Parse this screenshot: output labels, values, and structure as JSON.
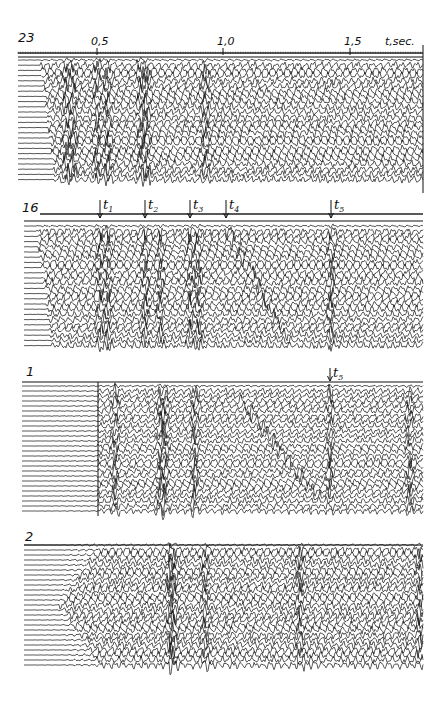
{
  "chart_data": {
    "type": "seismogram",
    "title": "",
    "xlabel": "t,sec.",
    "x_ticks": [
      {
        "label": "0,5",
        "value": 0.5,
        "px": 97
      },
      {
        "label": "1,0",
        "value": 1.0,
        "px": 223
      },
      {
        "label": "1,5",
        "value": 1.5,
        "px": 350
      }
    ],
    "x_axis_label": {
      "text": "t,sec.",
      "px": 385
    },
    "time_to_px": {
      "t0_px": -29,
      "px_per_sec": 253
    },
    "panels": [
      {
        "id": "23",
        "label": "23",
        "label_pos": [
          18,
          31
        ],
        "axis_y": 53,
        "top_line_y": 57,
        "trace_top": 60,
        "trace_count": 24,
        "trace_spacing": 5.2,
        "x_start": 18,
        "x_end": 423,
        "onset_start_px": 40,
        "onset_end_px": 55,
        "onset_direction": "diagonal",
        "intensity": 1.0,
        "bright_events_px": [
          66,
          73,
          97,
          108,
          141,
          147,
          205
        ],
        "markers": []
      },
      {
        "id": "16",
        "label": "16",
        "label_pos": [
          22,
          201
        ],
        "axis_y": 214,
        "top_line_y": 221,
        "trace_top": 226,
        "trace_count": 24,
        "trace_spacing": 5.2,
        "x_start": 24,
        "x_end": 423,
        "onset_start_px": 36,
        "onset_end_px": 52,
        "onset_direction": "diagonal",
        "intensity": 0.95,
        "bright_events_px": [
          100,
          108,
          145,
          160,
          190,
          198,
          331
        ],
        "dipping_event": {
          "x0": 226,
          "x1": 290,
          "y0": 226,
          "y1": 345
        },
        "markers": [
          {
            "label": "t",
            "sub": "1",
            "px": 100
          },
          {
            "label": "t",
            "sub": "2",
            "px": 145
          },
          {
            "label": "t",
            "sub": "3",
            "px": 190
          },
          {
            "label": "t",
            "sub": "4",
            "px": 226
          },
          {
            "label": "t",
            "sub": "5",
            "px": 331
          }
        ]
      },
      {
        "id": "1",
        "label": "1",
        "label_pos": [
          26,
          365
        ],
        "axis_y": null,
        "top_line_y": 382,
        "trace_top": 386,
        "trace_count": 26,
        "trace_spacing": 5.0,
        "x_start": 22,
        "x_end": 423,
        "onset_start_px": 98,
        "onset_end_px": 98,
        "onset_direction": "vertical",
        "vertical_line_px": 98,
        "intensity": 0.85,
        "bright_events_px": [
          115,
          160,
          165,
          195,
          330,
          410
        ],
        "dipping_event": {
          "x0": 240,
          "x1": 320,
          "y0": 400,
          "y1": 500
        },
        "markers": [
          {
            "label": "t",
            "sub": "5",
            "px": 330
          }
        ]
      },
      {
        "id": "2",
        "label": "2",
        "label_pos": [
          25,
          530
        ],
        "axis_y": null,
        "top_line_y": 545,
        "trace_top": 545,
        "trace_count": 25,
        "trace_spacing": 5.0,
        "x_start": 24,
        "x_end": 423,
        "onset_start_px": 100,
        "onset_end_px": 60,
        "onset_direction": "inverse",
        "intensity": 1.0,
        "bright_events_px": [
          170,
          174,
          205,
          300,
          420
        ],
        "markers": []
      }
    ]
  }
}
